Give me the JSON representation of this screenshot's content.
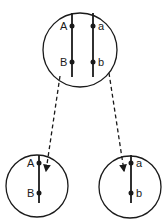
{
  "diagram": {
    "parent_cell": {
      "chromosomes": [
        {
          "loci": [
            {
              "label": "A"
            },
            {
              "label": "B"
            }
          ]
        },
        {
          "loci": [
            {
              "label": "a"
            },
            {
              "label": "b"
            }
          ]
        }
      ]
    },
    "daughter_cells": [
      {
        "loci": [
          {
            "label": "A"
          },
          {
            "label": "B"
          }
        ]
      },
      {
        "loci": [
          {
            "label": "a"
          },
          {
            "label": "b"
          }
        ]
      }
    ],
    "arrows": [
      {
        "from": "parent_cell",
        "to": "daughter_cells.0",
        "style": "dashed"
      },
      {
        "from": "parent_cell",
        "to": "daughter_cells.1",
        "style": "dashed"
      }
    ],
    "colors": {
      "stroke": "#1a1a1a",
      "background": "#ffffff"
    }
  }
}
